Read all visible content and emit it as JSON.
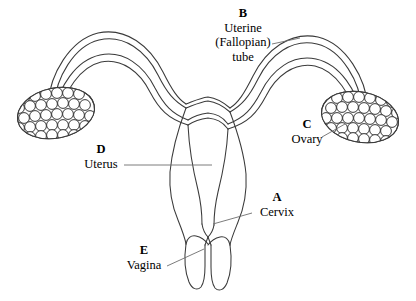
{
  "figure": {
    "type": "anatomical-diagram",
    "background_color": "#ffffff",
    "line_color": "#3a3a3a",
    "leader_color": "#6d6d6d",
    "text_color": "#000000"
  },
  "labels": {
    "a": {
      "letter": "A",
      "text": "Cervix",
      "structure": "cervix"
    },
    "b": {
      "letter": "B",
      "line1": "Uterine",
      "line2": "(Fallopian)",
      "line3": "tube",
      "structure": "uterine-fallopian-tube"
    },
    "c": {
      "letter": "C",
      "text": "Ovary",
      "structure": "ovary"
    },
    "d": {
      "letter": "D",
      "text": "Uterus",
      "structure": "uterus"
    },
    "e": {
      "letter": "E",
      "text": "Vagina",
      "structure": "vagina"
    }
  },
  "structures": {
    "left_ovary": "left-ovary",
    "right_ovary": "right-ovary",
    "left_tube": "left-fallopian-tube",
    "right_tube": "right-fallopian-tube",
    "uterus_body": "uterus-body",
    "uterine_cavity": "uterine-cavity",
    "cervix": "cervix",
    "vagina": "vagina"
  }
}
